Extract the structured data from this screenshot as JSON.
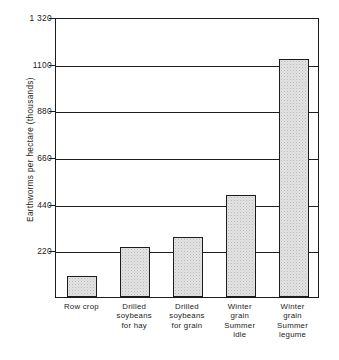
{
  "chart_data": {
    "type": "bar",
    "title": "",
    "xlabel": "",
    "ylabel": "Earthworms per hectare (thousands)",
    "ylim": [
      0,
      1320
    ],
    "yticks": [
      "220",
      "440",
      "660",
      "880",
      "1100",
      "1 320"
    ],
    "ytick_values": [
      220,
      440,
      660,
      880,
      1100,
      1320
    ],
    "grid": true,
    "legend": "none",
    "categories": [
      "Row crop",
      "Drilled\nsoybeans\nfor hay",
      "Drilled\nsoybeans\nfor grain",
      "Winter\ngrain\nSummer\nidle",
      "Winter\ngrain\nSummer\nlegume"
    ],
    "values": [
      100,
      237,
      281,
      481,
      1121
    ],
    "colors": {
      "bar_fill": "#e3e3e3",
      "bar_border": "#1c1c1c",
      "grid": "#1f1f1f",
      "axis": "#1c1c1c",
      "text": "#232323",
      "background": "#ffffff"
    }
  }
}
